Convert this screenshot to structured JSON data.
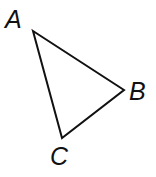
{
  "diagram": {
    "type": "triangle",
    "stroke_color": "#111111",
    "vertices": [
      {
        "id": "A",
        "label": "A",
        "x": 33,
        "y": 31
      },
      {
        "id": "B",
        "label": "B",
        "x": 124,
        "y": 90
      },
      {
        "id": "C",
        "label": "C",
        "x": 62,
        "y": 138
      }
    ],
    "edges": [
      {
        "from": "A",
        "to": "B"
      },
      {
        "from": "B",
        "to": "C"
      },
      {
        "from": "C",
        "to": "A"
      }
    ]
  }
}
